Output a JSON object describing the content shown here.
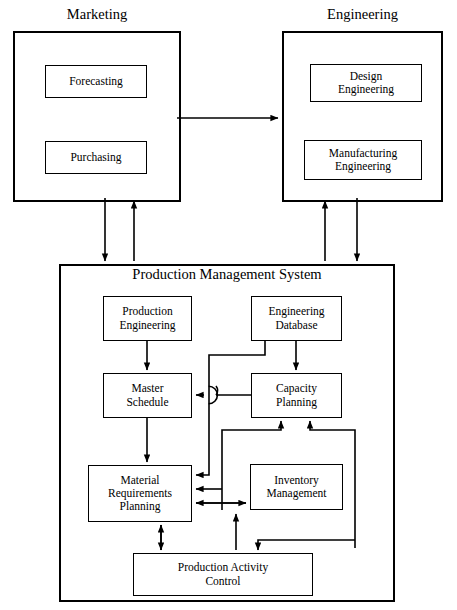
{
  "diagram": {
    "type": "block-diagram",
    "title_style": "Production Management System organizational block diagram",
    "groups": [
      {
        "id": "marketing",
        "label": "Marketing",
        "x": 13,
        "y": 31,
        "w": 168,
        "h": 171
      },
      {
        "id": "engineering",
        "label": "Engineering",
        "x": 282,
        "y": 31,
        "w": 161,
        "h": 171
      },
      {
        "id": "pms",
        "label": "Production Management System",
        "x": 59,
        "y": 264,
        "w": 336,
        "h": 338
      }
    ],
    "blocks": [
      {
        "id": "forecasting",
        "label": "Forecasting",
        "x": 45,
        "y": 65,
        "w": 102,
        "h": 33,
        "font": 11.5
      },
      {
        "id": "purchasing",
        "label": "Purchasing",
        "x": 45,
        "y": 141,
        "w": 102,
        "h": 33,
        "font": 11.5
      },
      {
        "id": "design-eng",
        "label": "Design\nEngineering",
        "x": 310,
        "y": 64,
        "w": 112,
        "h": 38,
        "font": 11.5
      },
      {
        "id": "manuf-eng",
        "label": "Manufacturing\nEngineering",
        "x": 304,
        "y": 140,
        "w": 118,
        "h": 40,
        "font": 11.5
      },
      {
        "id": "prod-eng",
        "label": "Production\nEngineering",
        "x": 103,
        "y": 296,
        "w": 89,
        "h": 45,
        "font": 11.5
      },
      {
        "id": "eng-db",
        "label": "Engineering\nDatabase",
        "x": 251,
        "y": 296,
        "w": 91,
        "h": 45,
        "font": 11.5
      },
      {
        "id": "master-sched",
        "label": "Master\nSchedule",
        "x": 103,
        "y": 373,
        "w": 89,
        "h": 45,
        "font": 11.5
      },
      {
        "id": "capacity-plan",
        "label": "Capacity\nPlanning",
        "x": 251,
        "y": 373,
        "w": 91,
        "h": 45,
        "font": 11.5
      },
      {
        "id": "mrp",
        "label": "Material\nRequirements\nPlanning",
        "x": 88,
        "y": 465,
        "w": 104,
        "h": 57,
        "font": 11.5
      },
      {
        "id": "inventory",
        "label": "Inventory\nManagement",
        "x": 250,
        "y": 464,
        "w": 93,
        "h": 46,
        "font": 11.5
      },
      {
        "id": "pac",
        "label": "Production Activity\nControl",
        "x": 133,
        "y": 553,
        "w": 180,
        "h": 43,
        "font": 11.5
      }
    ],
    "connections": [
      {
        "from": "marketing",
        "to": "engineering",
        "style": "single-arrow",
        "direction": "right"
      },
      {
        "from": "marketing",
        "to": "pms",
        "style": "single-arrow",
        "direction": "down"
      },
      {
        "from": "pms",
        "to": "marketing",
        "style": "single-arrow",
        "direction": "up"
      },
      {
        "from": "pms",
        "to": "engineering",
        "style": "single-arrow",
        "direction": "up"
      },
      {
        "from": "engineering",
        "to": "pms",
        "style": "single-arrow",
        "direction": "down"
      },
      {
        "from": "prod-eng",
        "to": "master-sched",
        "style": "single-arrow",
        "direction": "down"
      },
      {
        "from": "eng-db",
        "to": "capacity-plan",
        "style": "single-arrow",
        "direction": "down"
      },
      {
        "from": "eng-db",
        "to": "mrp",
        "style": "single-arrow",
        "direction": "routed-left-down"
      },
      {
        "from": "capacity-plan",
        "to": "master-sched",
        "style": "single-arrow-with-jump",
        "direction": "left"
      },
      {
        "from": "master-sched",
        "to": "mrp",
        "style": "single-arrow",
        "direction": "down"
      },
      {
        "from": "inventory",
        "to": "capacity-plan",
        "style": "single-arrow",
        "direction": "routed-up"
      },
      {
        "from": "pac",
        "to": "capacity-plan",
        "style": "single-arrow",
        "direction": "routed-right-up"
      },
      {
        "from": "mrp",
        "to": "inventory",
        "style": "double-arrow",
        "direction": "horizontal"
      },
      {
        "from": "mrp",
        "to": "pac",
        "style": "double-arrow",
        "direction": "vertical"
      },
      {
        "from": "pac",
        "to": "inventory",
        "style": "single-arrow",
        "direction": "up"
      },
      {
        "from": "capacity-plan",
        "to": "pac",
        "style": "single-arrow",
        "direction": "routed-right-down"
      },
      {
        "from": "inventory",
        "to": "mrp",
        "style": "single-arrow",
        "direction": "routed-left"
      }
    ],
    "colors": {
      "line": "#000000",
      "background": "#ffffff",
      "text": "#000000"
    }
  }
}
